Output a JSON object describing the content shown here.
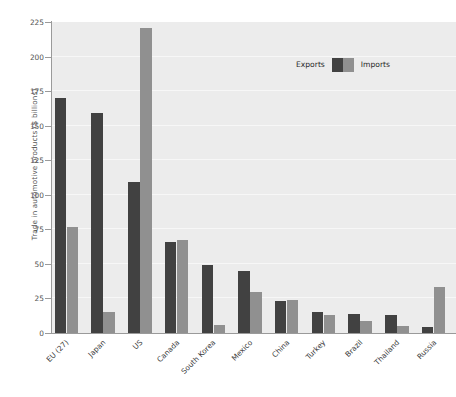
{
  "chart_data": {
    "type": "bar",
    "title": "",
    "xlabel": "",
    "ylabel": "Trade in automotive products ($ billions)",
    "ylim": [
      0,
      225
    ],
    "yticks": [
      0,
      25,
      50,
      75,
      100,
      125,
      150,
      175,
      200,
      225
    ],
    "ytick_labels": [
      "0",
      "25",
      "50",
      "75",
      "100",
      "125",
      "150",
      "175",
      "200",
      "225"
    ],
    "grid": true,
    "grid_axis": "y",
    "legend_position": "top-right",
    "categories": [
      "EU (27)",
      "Japan",
      "US",
      "Canada",
      "South Korea",
      "Mexico",
      "China",
      "Turkey",
      "Brazil",
      "Thailand",
      "Russia"
    ],
    "series": [
      {
        "name": "Exports",
        "color": "#414141",
        "values": [
          170,
          159,
          109,
          66,
          49,
          45,
          23,
          15,
          14,
          13,
          4
        ]
      },
      {
        "name": "Imports",
        "color": "#909090",
        "values": [
          77,
          15,
          221,
          67,
          6,
          30,
          24,
          13,
          9,
          5,
          33
        ]
      }
    ]
  },
  "colors": {
    "exports": "#414141",
    "imports": "#909090",
    "plot_background": "#ececec",
    "gridline": "#f7f7f7",
    "axis": "#9a9a9a",
    "tick_text": "#555555",
    "label_text": "#3a3a3a"
  }
}
